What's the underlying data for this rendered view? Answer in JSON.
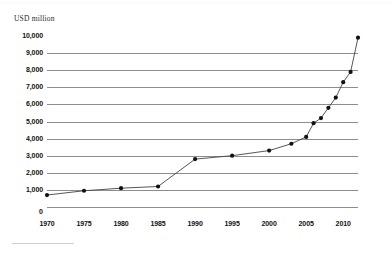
{
  "axis_title": "USD million",
  "chart_data": {
    "type": "line",
    "title": "",
    "subtitle": "",
    "xlabel": "",
    "ylabel": "USD million",
    "ylim": [
      0,
      10000
    ],
    "xlim": [
      1970,
      2012
    ],
    "grid": true,
    "legend": null,
    "y_ticks": [
      "10,000",
      "9,000",
      "8,000",
      "7,000",
      "6,000",
      "5,000",
      "4,000",
      "3,000",
      "2,000",
      "1,000",
      "0"
    ],
    "y_tick_values": [
      10000,
      9000,
      8000,
      7000,
      6000,
      5000,
      4000,
      3000,
      2000,
      1000,
      0
    ],
    "x_ticks": [
      "1970",
      "1975",
      "1980",
      "1985",
      "1990",
      "1995",
      "2000",
      "2005",
      "2010"
    ],
    "x_tick_values": [
      1970,
      1975,
      1980,
      1985,
      1990,
      1995,
      2000,
      2005,
      2010
    ],
    "series": [
      {
        "name": "USD million",
        "color": "#444444",
        "marker": "circle",
        "x": [
          1970,
          1975,
          1980,
          1985,
          1990,
          1995,
          2000,
          2003,
          2005,
          2006,
          2007,
          2008,
          2009,
          2010,
          2011,
          2012
        ],
        "values": [
          700,
          950,
          1100,
          1200,
          2800,
          3000,
          3300,
          3700,
          4100,
          4900,
          5200,
          5800,
          6400,
          7300,
          7900,
          9900
        ]
      }
    ]
  }
}
